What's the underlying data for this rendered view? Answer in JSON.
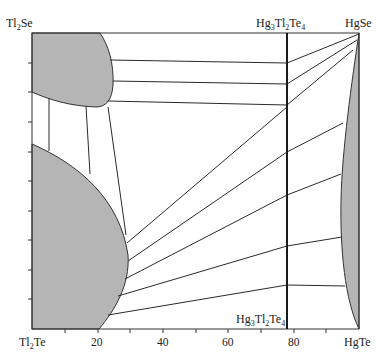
{
  "diagram": {
    "type": "ternary-section phase diagram (isothermal)",
    "corners": {
      "top_left": "Tl2Se",
      "top_right": "HgSe",
      "bottom_left": "Tl2Te",
      "bottom_right": "HgTe"
    },
    "compound_line_label_top": "Hg3Tl2Te4",
    "compound_line_label_bottom": "Hg3Tl2Te4",
    "compound_line_position": 78,
    "x_axis": {
      "ticks": [
        {
          "value": 20,
          "label": "20"
        },
        {
          "value": 40,
          "label": "40"
        },
        {
          "value": 60,
          "label": "60"
        },
        {
          "value": 80,
          "label": "80"
        }
      ],
      "range": [
        0,
        100
      ]
    },
    "region_color": "#b5b5b5",
    "line_color": "#2a2a2a"
  }
}
